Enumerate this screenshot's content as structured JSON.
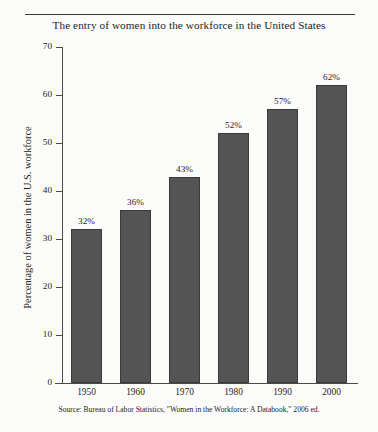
{
  "chart_data": {
    "type": "bar",
    "title": "The entry of women into the workforce in the United States",
    "xlabel": "",
    "ylabel": "Percentage of women in the U.S. workforce",
    "categories": [
      "1950",
      "1960",
      "1970",
      "1980",
      "1990",
      "2000"
    ],
    "values": [
      32,
      36,
      43,
      52,
      57,
      62
    ],
    "data_labels": [
      "32%",
      "36%",
      "43%",
      "52%",
      "57%",
      "62%"
    ],
    "ylim": [
      0,
      70
    ],
    "ytick_values": [
      0,
      10,
      20,
      30,
      40,
      50,
      60,
      70
    ],
    "ytick_labels": [
      "0",
      "10",
      "20",
      "30",
      "40",
      "50",
      "60",
      "70"
    ],
    "grid": false,
    "legend": false,
    "legend_position": "none",
    "bar_color": "#545454",
    "background_color": "#fbfbf9",
    "axis_color": "#4a4a4a",
    "source": "Source: Bureau of Labor Statistics, \"Women in the Workforce: A Databook,\" 2006 ed."
  }
}
